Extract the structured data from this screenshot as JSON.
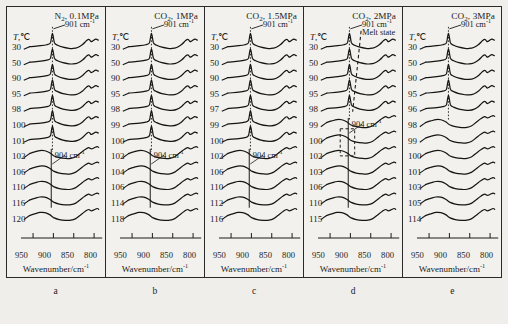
{
  "figure": {
    "axis_title": "Wavenumber/cm",
    "axis_title_sup": "-1",
    "temp_axis_label": "T, ℃",
    "peak_label_901": "901 cm",
    "peak_label_904": "904 cm",
    "peak_sup": "-1",
    "melt_label": "Melt state",
    "xticks": [
      "950",
      "900",
      "850",
      "800"
    ],
    "letters": [
      "a",
      "b",
      "c",
      "d",
      "e"
    ]
  },
  "chart_data": {
    "type": "line",
    "xlabel": "Wavenumber/cm-1",
    "ylabel": "Intensity (offset, a.u.)",
    "xlim": [
      960,
      785
    ],
    "grid": false,
    "legend": "none",
    "xticks": [
      950,
      900,
      850,
      800
    ],
    "annotations": [
      {
        "label": "901 cm-1",
        "x": 901,
        "panels": [
          "a",
          "b",
          "c",
          "d",
          "e"
        ],
        "type": "dotted-vertical-guide"
      },
      {
        "label": "904 cm-1",
        "x": 904,
        "panels": [
          "a",
          "b",
          "c",
          "d"
        ],
        "type": "solid-vertical-guide"
      },
      {
        "label": "Melt state",
        "panels": [
          "d"
        ],
        "type": "dashed-diagonal-line"
      },
      {
        "label": "transition-region-box",
        "panels": [
          "d"
        ],
        "type": "dashed-rectangle",
        "temperatures": [
          99,
          100
        ]
      }
    ],
    "panels": [
      {
        "letter": "a",
        "title": "N2, 0.1MPa",
        "gas": "N2",
        "pressure_MPa": 0.1,
        "temperatures_C": [
          30,
          50,
          90,
          95,
          98,
          100,
          101,
          102,
          106,
          110,
          116,
          120
        ],
        "melt_onset_C": 102,
        "crystalline_peak_cm1": 901,
        "melt_peak_cm1": 904
      },
      {
        "letter": "b",
        "title": "CO2, 1MPa",
        "gas": "CO2",
        "pressure_MPa": 1,
        "temperatures_C": [
          30,
          50,
          90,
          95,
          98,
          99,
          100,
          102,
          104,
          106,
          114,
          118
        ],
        "melt_onset_C": 102,
        "crystalline_peak_cm1": 901,
        "melt_peak_cm1": 904
      },
      {
        "letter": "c",
        "title": "CO2, 1.5MPa",
        "gas": "CO2",
        "pressure_MPa": 1.5,
        "temperatures_C": [
          30,
          50,
          90,
          95,
          97,
          99,
          100,
          102,
          106,
          110,
          112,
          116
        ],
        "melt_onset_C": 102,
        "crystalline_peak_cm1": 901,
        "melt_peak_cm1": 904
      },
      {
        "letter": "d",
        "title": "CO2, 2MPa",
        "gas": "CO2",
        "pressure_MPa": 2,
        "temperatures_C": [
          30,
          50,
          90,
          95,
          98,
          99,
          100,
          102,
          103,
          106,
          110,
          115
        ],
        "melt_onset_C": 99,
        "crystalline_peak_cm1": 901,
        "melt_peak_cm1": 904
      },
      {
        "letter": "e",
        "title": "CO2, 3MPa",
        "gas": "CO2",
        "pressure_MPa": 3,
        "temperatures_C": [
          30,
          50,
          90,
          95,
          96,
          98,
          99,
          100,
          101,
          103,
          105,
          114
        ],
        "melt_onset_C": 98,
        "crystalline_peak_cm1": 901,
        "melt_peak_cm1": null
      }
    ]
  }
}
